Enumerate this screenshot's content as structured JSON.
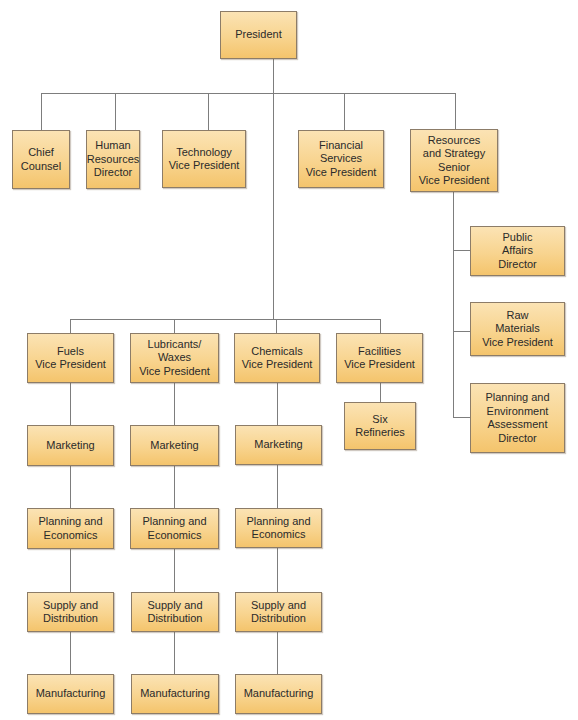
{
  "diagram": {
    "type": "org-chart",
    "style": {
      "box_top_color": "#fbe3b4",
      "box_bottom_color": "#f4c46c",
      "box_border_color": "#8c7c68",
      "line_color": "#7d7d7d"
    },
    "root": {
      "label": "President"
    },
    "staff": [
      {
        "label": "Chief\nCounsel"
      },
      {
        "label": "Human\nResources\nDirector"
      },
      {
        "label": "Technology\nVice President"
      },
      {
        "label": "Financial\nServices\nVice President"
      },
      {
        "label": "Resources\nand Strategy\nSenior\nVice President"
      }
    ],
    "resources_reports": [
      {
        "label": "Public\nAffairs\nDirector"
      },
      {
        "label": "Raw\nMaterials\nVice President"
      },
      {
        "label": "Planning and\nEnvironment\nAssessment\nDirector"
      }
    ],
    "divisions": [
      {
        "label": "Fuels\nVice President",
        "units": [
          "Marketing",
          "Planning and\nEconomics",
          "Supply and\nDistribution",
          "Manufacturing"
        ]
      },
      {
        "label": "Lubricants/\nWaxes\nVice President",
        "units": [
          "Marketing",
          "Planning and\nEconomics",
          "Supply and\nDistribution",
          "Manufacturing"
        ]
      },
      {
        "label": "Chemicals\nVice President",
        "units": [
          "Marketing",
          "Planning and\nEconomics",
          "Supply and\nDistribution",
          "Manufacturing"
        ]
      },
      {
        "label": "Facilities\nVice President",
        "units": [
          "Six\nRefineries"
        ]
      }
    ]
  }
}
